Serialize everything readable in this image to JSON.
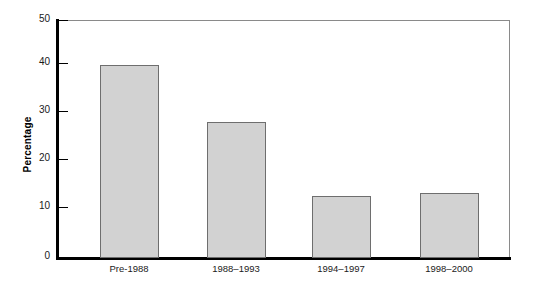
{
  "chart_data": {
    "type": "bar",
    "title": "",
    "xlabel": "",
    "ylabel": "Percentage",
    "categories": [
      "Pre-1988",
      "1988–1993",
      "1994–1997",
      "1998–2000"
    ],
    "values": [
      40.5,
      28.5,
      13.0,
      13.6
    ],
    "ylim": [
      0,
      50
    ],
    "yticks": [
      0,
      10,
      20,
      30,
      40,
      50
    ],
    "ytick_labels": [
      "0",
      "10",
      "20",
      "30",
      "40",
      "50"
    ],
    "grid": false,
    "legend": null,
    "bar_fill_color": "#d2d2d2",
    "bar_edge_color": "#6e6e6e",
    "axis_color": "#000000",
    "frame_color": "#8a8a8a"
  }
}
